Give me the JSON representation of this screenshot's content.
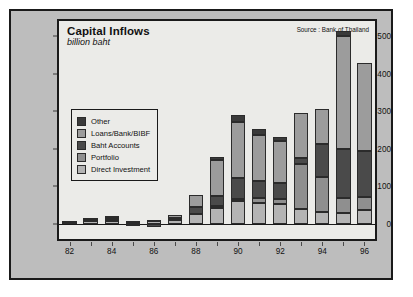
{
  "chart_data": {
    "type": "bar",
    "stacked": true,
    "title": "Capital Inflows",
    "subtitle": "billion baht",
    "source": "Source : Bank of Thailand",
    "xlabel": "",
    "ylabel": "",
    "ylim": [
      -40,
      540
    ],
    "yticks": [
      0,
      100,
      200,
      300,
      400,
      500
    ],
    "ytick_labels": [
      "0",
      "100",
      "200",
      "300",
      "400",
      "500"
    ],
    "grid": false,
    "legend_position": "inside-left",
    "categories": [
      "82",
      "83",
      "84",
      "85",
      "86",
      "87",
      "88",
      "89",
      "90",
      "91",
      "92",
      "93",
      "94",
      "95",
      "96"
    ],
    "xtick_labels": [
      "82",
      "84",
      "86",
      "88",
      "90",
      "92",
      "94",
      "96"
    ],
    "series": [
      {
        "name": "Direct Investment",
        "color": "#b4b4b4",
        "values": [
          6,
          8,
          8,
          4,
          7,
          10,
          27,
          43,
          60,
          56,
          54,
          40,
          33,
          30,
          37
        ]
      },
      {
        "name": "Portfolio",
        "color": "#8f8f8f",
        "values": [
          0,
          0,
          2,
          0,
          0,
          4,
          0,
          6,
          6,
          12,
          12,
          120,
          92,
          40,
          34
        ]
      },
      {
        "name": "Baht Accounts",
        "color": "#4a4a4a",
        "values": [
          0,
          3,
          5,
          -5,
          -8,
          3,
          17,
          25,
          55,
          46,
          44,
          16,
          88,
          130,
          124
        ]
      },
      {
        "name": "Loans/Bank/BIBF",
        "color": "#9c9c9c",
        "values": [
          2,
          4,
          6,
          4,
          3,
          6,
          32,
          96,
          150,
          122,
          110,
          120,
          92,
          300,
          232
        ]
      },
      {
        "name": "Other",
        "color": "#3a3a3a",
        "values": [
          0,
          0,
          0,
          0,
          0,
          0,
          0,
          8,
          20,
          16,
          12,
          0,
          0,
          14,
          0
        ]
      }
    ]
  }
}
